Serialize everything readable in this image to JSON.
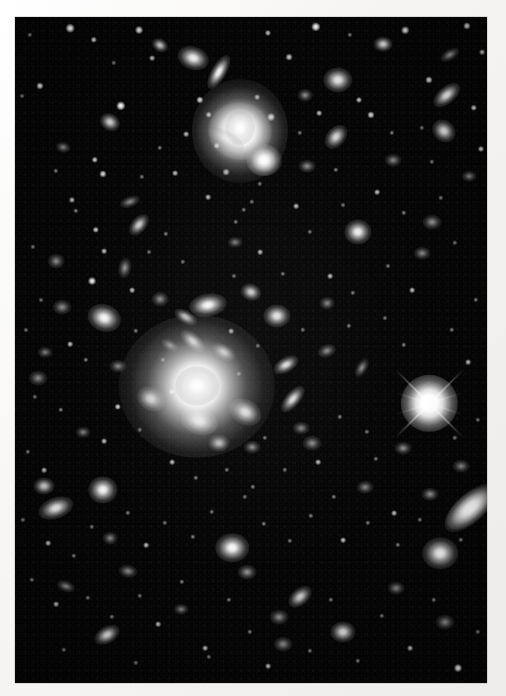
{
  "image": {
    "kind": "astronomical-photograph",
    "subject": "galaxy cluster field",
    "medium": "black-and-white photographic print with white border",
    "width": 506,
    "height": 696,
    "sky_field": {
      "x": 15,
      "y": 17,
      "width": 472,
      "height": 666
    },
    "border_color": "#f4f3f1",
    "sky_color": "#050505",
    "object_color": "#ffffff",
    "alt_text": "Dense field of faint fuzzy galaxies and point-like stars on a black sky, dominated by two bright elliptical galaxies near the centre and upper middle, with one bright foreground star showing four diffraction spikes at the right."
  },
  "sky_objects": {
    "notable": [
      {
        "name": "central-cd-galaxy",
        "x": 197,
        "y": 386,
        "size": 46,
        "type": "cD elliptical",
        "brightness": "brightest diffuse object"
      },
      {
        "name": "upper-bright-galaxy",
        "x": 240,
        "y": 131,
        "size": 40,
        "type": "elliptical with plume",
        "brightness": "very bright"
      },
      {
        "name": "bright-diffraction-star",
        "x": 429,
        "y": 403,
        "size": 22,
        "type": "foreground star",
        "brightness": "brightest point source",
        "spikes": 4
      },
      {
        "name": "edge-on-elliptical",
        "x": 470,
        "y": 508,
        "size": 28,
        "type": "elongated elliptical"
      },
      {
        "name": "companion-galaxy",
        "x": 264,
        "y": 160,
        "size": 17,
        "type": "elliptical"
      }
    ],
    "galaxies": [
      [
        193,
        58,
        15,
        11,
        20,
        0.95
      ],
      [
        219,
        72,
        18,
        7,
        120,
        0.9
      ],
      [
        240,
        131,
        30,
        27,
        10,
        1.0
      ],
      [
        264,
        160,
        17,
        15,
        0,
        0.95
      ],
      [
        160,
        45,
        8,
        6,
        30,
        0.6
      ],
      [
        383,
        44,
        9,
        7,
        0,
        0.7
      ],
      [
        338,
        80,
        14,
        12,
        0,
        0.8
      ],
      [
        447,
        95,
        15,
        8,
        140,
        0.8
      ],
      [
        444,
        131,
        12,
        10,
        40,
        0.7
      ],
      [
        450,
        55,
        10,
        5,
        150,
        0.55
      ],
      [
        305,
        95,
        7,
        6,
        0,
        0.5
      ],
      [
        110,
        122,
        10,
        8,
        30,
        0.65
      ],
      [
        63,
        147,
        7,
        5,
        10,
        0.45
      ],
      [
        130,
        202,
        10,
        5,
        160,
        0.5
      ],
      [
        139,
        225,
        12,
        7,
        130,
        0.6
      ],
      [
        56,
        261,
        8,
        7,
        0,
        0.5
      ],
      [
        125,
        268,
        10,
        6,
        100,
        0.55
      ],
      [
        336,
        137,
        13,
        9,
        130,
        0.65
      ],
      [
        307,
        166,
        8,
        6,
        0,
        0.5
      ],
      [
        358,
        232,
        13,
        12,
        0,
        0.8
      ],
      [
        432,
        222,
        9,
        7,
        0,
        0.55
      ],
      [
        104,
        318,
        16,
        13,
        20,
        0.85
      ],
      [
        62,
        307,
        9,
        7,
        0,
        0.5
      ],
      [
        160,
        299,
        8,
        7,
        0,
        0.5
      ],
      [
        208,
        305,
        18,
        11,
        170,
        0.85
      ],
      [
        251,
        292,
        10,
        8,
        20,
        0.6
      ],
      [
        277,
        316,
        13,
        11,
        0,
        0.75
      ],
      [
        327,
        303,
        7,
        6,
        0,
        0.45
      ],
      [
        186,
        317,
        12,
        6,
        30,
        0.6
      ],
      [
        193,
        341,
        14,
        7,
        40,
        0.7
      ],
      [
        170,
        345,
        9,
        5,
        30,
        0.5
      ],
      [
        224,
        352,
        12,
        7,
        30,
        0.6
      ],
      [
        151,
        399,
        14,
        11,
        30,
        0.75
      ],
      [
        199,
        421,
        18,
        13,
        20,
        0.9
      ],
      [
        245,
        412,
        16,
        12,
        30,
        0.85
      ],
      [
        219,
        443,
        10,
        8,
        0,
        0.6
      ],
      [
        252,
        447,
        8,
        6,
        0,
        0.5
      ],
      [
        293,
        399,
        15,
        7,
        130,
        0.7
      ],
      [
        286,
        365,
        13,
        7,
        150,
        0.7
      ],
      [
        301,
        428,
        8,
        6,
        0,
        0.45
      ],
      [
        327,
        351,
        9,
        6,
        160,
        0.5
      ],
      [
        312,
        443,
        9,
        7,
        0,
        0.5
      ],
      [
        362,
        368,
        10,
        5,
        120,
        0.5
      ],
      [
        470,
        508,
        27,
        13,
        140,
        0.95
      ],
      [
        430,
        494,
        8,
        6,
        0,
        0.55
      ],
      [
        403,
        448,
        8,
        6,
        0,
        0.5
      ],
      [
        440,
        553,
        17,
        15,
        0,
        0.9
      ],
      [
        56,
        508,
        17,
        10,
        160,
        0.8
      ],
      [
        103,
        490,
        14,
        13,
        0,
        0.85
      ],
      [
        44,
        486,
        10,
        8,
        0,
        0.6
      ],
      [
        110,
        538,
        7,
        6,
        0,
        0.45
      ],
      [
        66,
        586,
        9,
        5,
        20,
        0.5
      ],
      [
        128,
        571,
        9,
        6,
        10,
        0.5
      ],
      [
        232,
        548,
        16,
        14,
        0,
        0.9
      ],
      [
        247,
        572,
        9,
        7,
        0,
        0.55
      ],
      [
        181,
        609,
        7,
        5,
        0,
        0.4
      ],
      [
        279,
        617,
        9,
        7,
        0,
        0.5
      ],
      [
        107,
        635,
        13,
        8,
        150,
        0.7
      ],
      [
        283,
        644,
        9,
        7,
        0,
        0.5
      ],
      [
        343,
        632,
        12,
        10,
        0,
        0.7
      ],
      [
        300,
        597,
        13,
        8,
        140,
        0.6
      ],
      [
        396,
        588,
        8,
        6,
        0,
        0.45
      ],
      [
        445,
        622,
        9,
        7,
        0,
        0.5
      ],
      [
        461,
        466,
        8,
        6,
        0,
        0.45
      ],
      [
        422,
        253,
        8,
        6,
        0,
        0.45
      ],
      [
        469,
        176,
        7,
        5,
        0,
        0.4
      ],
      [
        393,
        160,
        8,
        6,
        0,
        0.45
      ],
      [
        38,
        378,
        9,
        7,
        0,
        0.5
      ],
      [
        45,
        352,
        7,
        5,
        0,
        0.4
      ],
      [
        118,
        366,
        8,
        6,
        0,
        0.45
      ],
      [
        365,
        487,
        8,
        6,
        0,
        0.42
      ],
      [
        235,
        242,
        7,
        5,
        0,
        0.4
      ],
      [
        83,
        432,
        7,
        5,
        0,
        0.4
      ]
    ],
    "stars": [
      [
        70,
        28,
        2.4,
        0.85
      ],
      [
        94,
        40,
        1.8,
        0.6
      ],
      [
        139,
        30,
        2.2,
        0.75
      ],
      [
        152,
        58,
        1.6,
        0.5
      ],
      [
        268,
        33,
        1.7,
        0.55
      ],
      [
        289,
        57,
        1.9,
        0.6
      ],
      [
        316,
        27,
        2.6,
        0.9
      ],
      [
        350,
        35,
        1.5,
        0.45
      ],
      [
        405,
        30,
        2.1,
        0.7
      ],
      [
        467,
        26,
        2.0,
        0.65
      ],
      [
        482,
        52,
        1.6,
        0.5
      ],
      [
        30,
        35,
        1.5,
        0.45
      ],
      [
        40,
        86,
        2.0,
        0.7
      ],
      [
        22,
        96,
        1.4,
        0.4
      ],
      [
        121,
        106,
        2.6,
        0.9
      ],
      [
        200,
        100,
        2.0,
        0.65
      ],
      [
        209,
        115,
        1.8,
        0.6
      ],
      [
        226,
        172,
        1.9,
        0.6
      ],
      [
        257,
        97,
        1.6,
        0.5
      ],
      [
        271,
        117,
        2.2,
        0.75
      ],
      [
        319,
        113,
        1.6,
        0.5
      ],
      [
        359,
        100,
        1.7,
        0.55
      ],
      [
        371,
        115,
        2.0,
        0.65
      ],
      [
        429,
        80,
        2.0,
        0.65
      ],
      [
        474,
        108,
        1.8,
        0.6
      ],
      [
        481,
        149,
        1.7,
        0.55
      ],
      [
        336,
        170,
        1.5,
        0.45
      ],
      [
        95,
        160,
        1.8,
        0.6
      ],
      [
        56,
        171,
        1.5,
        0.45
      ],
      [
        72,
        200,
        1.7,
        0.5
      ],
      [
        76,
        211,
        1.5,
        0.45
      ],
      [
        103,
        174,
        2.0,
        0.65
      ],
      [
        142,
        177,
        1.5,
        0.4
      ],
      [
        96,
        230,
        1.8,
        0.55
      ],
      [
        104,
        251,
        1.6,
        0.5
      ],
      [
        149,
        252,
        1.4,
        0.4
      ],
      [
        92,
        281,
        2.2,
        0.75
      ],
      [
        132,
        290,
        1.6,
        0.5
      ],
      [
        166,
        234,
        1.5,
        0.45
      ],
      [
        183,
        262,
        1.5,
        0.4
      ],
      [
        208,
        197,
        1.6,
        0.5
      ],
      [
        244,
        210,
        1.5,
        0.4
      ],
      [
        296,
        206,
        1.6,
        0.5
      ],
      [
        310,
        232,
        1.5,
        0.4
      ],
      [
        343,
        205,
        1.4,
        0.4
      ],
      [
        377,
        192,
        1.6,
        0.5
      ],
      [
        404,
        213,
        1.5,
        0.45
      ],
      [
        441,
        198,
        1.5,
        0.4
      ],
      [
        455,
        243,
        1.5,
        0.4
      ],
      [
        260,
        252,
        1.6,
        0.5
      ],
      [
        283,
        274,
        1.5,
        0.4
      ],
      [
        234,
        276,
        1.4,
        0.4
      ],
      [
        330,
        276,
        1.6,
        0.5
      ],
      [
        353,
        293,
        1.5,
        0.45
      ],
      [
        388,
        266,
        1.4,
        0.4
      ],
      [
        412,
        290,
        1.6,
        0.5
      ],
      [
        476,
        300,
        1.5,
        0.45
      ],
      [
        33,
        247,
        1.5,
        0.4
      ],
      [
        41,
        300,
        1.4,
        0.4
      ],
      [
        26,
        330,
        1.4,
        0.4
      ],
      [
        70,
        344,
        1.6,
        0.5
      ],
      [
        136,
        331,
        1.5,
        0.45
      ],
      [
        163,
        360,
        1.5,
        0.45
      ],
      [
        231,
        331,
        1.6,
        0.5
      ],
      [
        258,
        346,
        1.5,
        0.4
      ],
      [
        303,
        330,
        1.5,
        0.4
      ],
      [
        349,
        326,
        1.5,
        0.45
      ],
      [
        385,
        318,
        1.4,
        0.4
      ],
      [
        404,
        345,
        1.5,
        0.45
      ],
      [
        452,
        330,
        1.5,
        0.45
      ],
      [
        468,
        362,
        1.6,
        0.5
      ],
      [
        35,
        397,
        1.5,
        0.4
      ],
      [
        61,
        410,
        1.5,
        0.45
      ],
      [
        118,
        407,
        1.8,
        0.6
      ],
      [
        104,
        441,
        1.6,
        0.5
      ],
      [
        140,
        430,
        1.5,
        0.45
      ],
      [
        172,
        462,
        1.6,
        0.5
      ],
      [
        196,
        478,
        1.5,
        0.45
      ],
      [
        227,
        470,
        1.5,
        0.4
      ],
      [
        253,
        487,
        1.5,
        0.45
      ],
      [
        285,
        470,
        1.5,
        0.4
      ],
      [
        318,
        462,
        1.6,
        0.5
      ],
      [
        334,
        497,
        1.5,
        0.45
      ],
      [
        376,
        459,
        1.5,
        0.4
      ],
      [
        394,
        513,
        1.6,
        0.5
      ],
      [
        455,
        438,
        1.5,
        0.45
      ],
      [
        478,
        420,
        1.5,
        0.4
      ],
      [
        28,
        452,
        1.5,
        0.45
      ],
      [
        44,
        470,
        1.6,
        0.5
      ],
      [
        23,
        520,
        1.5,
        0.45
      ],
      [
        48,
        543,
        1.6,
        0.5
      ],
      [
        74,
        556,
        1.5,
        0.45
      ],
      [
        92,
        527,
        1.5,
        0.4
      ],
      [
        128,
        513,
        1.5,
        0.45
      ],
      [
        146,
        545,
        1.6,
        0.5
      ],
      [
        165,
        523,
        1.5,
        0.4
      ],
      [
        193,
        537,
        1.5,
        0.45
      ],
      [
        212,
        512,
        1.5,
        0.4
      ],
      [
        264,
        524,
        1.5,
        0.45
      ],
      [
        290,
        541,
        1.5,
        0.4
      ],
      [
        311,
        516,
        1.5,
        0.45
      ],
      [
        343,
        540,
        1.6,
        0.5
      ],
      [
        368,
        523,
        1.5,
        0.4
      ],
      [
        398,
        545,
        1.5,
        0.45
      ],
      [
        420,
        520,
        1.5,
        0.4
      ],
      [
        461,
        540,
        1.5,
        0.45
      ],
      [
        32,
        580,
        1.5,
        0.45
      ],
      [
        56,
        604,
        1.6,
        0.5
      ],
      [
        88,
        598,
        1.5,
        0.4
      ],
      [
        112,
        617,
        1.5,
        0.45
      ],
      [
        140,
        596,
        1.5,
        0.4
      ],
      [
        158,
        624,
        1.6,
        0.5
      ],
      [
        182,
        582,
        1.5,
        0.45
      ],
      [
        205,
        648,
        1.6,
        0.5
      ],
      [
        229,
        600,
        1.5,
        0.4
      ],
      [
        250,
        632,
        1.5,
        0.45
      ],
      [
        268,
        666,
        1.6,
        0.5
      ],
      [
        310,
        651,
        1.5,
        0.45
      ],
      [
        331,
        600,
        1.5,
        0.4
      ],
      [
        358,
        661,
        1.5,
        0.45
      ],
      [
        382,
        616,
        1.5,
        0.4
      ],
      [
        410,
        648,
        1.6,
        0.5
      ],
      [
        434,
        600,
        1.5,
        0.45
      ],
      [
        458,
        668,
        2.2,
        0.8
      ],
      [
        478,
        632,
        1.5,
        0.45
      ],
      [
        245,
        497,
        1.5,
        0.4
      ],
      [
        175,
        173,
        1.6,
        0.5
      ],
      [
        217,
        146,
        1.8,
        0.6
      ],
      [
        252,
        202,
        1.5,
        0.4
      ],
      [
        86,
        360,
        1.5,
        0.45
      ],
      [
        172,
        392,
        1.8,
        0.6
      ],
      [
        239,
        374,
        1.5,
        0.45
      ],
      [
        265,
        438,
        1.5,
        0.4
      ],
      [
        340,
        417,
        1.5,
        0.45
      ],
      [
        367,
        432,
        1.5,
        0.4
      ],
      [
        209,
        657,
        1.5,
        0.4
      ],
      [
        136,
        663,
        1.5,
        0.4
      ],
      [
        64,
        650,
        1.5,
        0.4
      ],
      [
        422,
        128,
        1.5,
        0.4
      ],
      [
        392,
        133,
        1.5,
        0.45
      ],
      [
        300,
        133,
        1.5,
        0.4
      ],
      [
        236,
        222,
        1.5,
        0.4
      ],
      [
        160,
        148,
        1.5,
        0.4
      ],
      [
        114,
        63,
        1.5,
        0.4
      ],
      [
        186,
        134,
        1.6,
        0.5
      ],
      [
        260,
        184,
        1.5,
        0.4
      ],
      [
        432,
        162,
        1.5,
        0.4
      ]
    ]
  },
  "labels": {
    "field_label": "sky field",
    "border_label": "print border"
  }
}
